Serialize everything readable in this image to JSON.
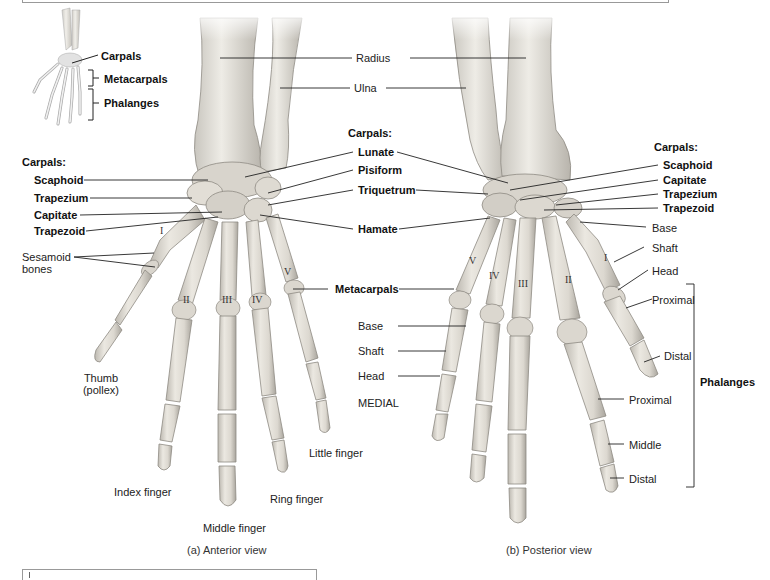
{
  "inset": {
    "labels": {
      "carpals": "Carpals",
      "metacarpals": "Metacarpals",
      "phalanges": "Phalanges"
    }
  },
  "forearm": {
    "radius": "Radius",
    "ulna": "Ulna"
  },
  "anterior_view": {
    "caption": "(a) Anterior view",
    "carpals_heading": "Carpals:",
    "carpals_left": [
      "Scaphoid",
      "Trapezium",
      "Capitate",
      "Trapezoid"
    ],
    "sesamoid": [
      "Sesamoid",
      "bones"
    ],
    "thumb": [
      "Thumb",
      "(pollex)"
    ],
    "fingers": {
      "index": "Index finger",
      "middle": "Middle finger",
      "ring": "Ring finger",
      "little": "Little finger"
    },
    "metacarpal_numerals": [
      "I",
      "II",
      "III",
      "IV",
      "V"
    ]
  },
  "center_labels": {
    "carpals_heading": "Carpals:",
    "carpals": [
      "Lunate",
      "Pisiform",
      "Triquetrum",
      "Hamate"
    ],
    "metacarpals": "Metacarpals"
  },
  "posterior_view": {
    "caption": "(b) Posterior view",
    "carpals_heading": "Carpals:",
    "carpals_right": [
      "Scaphoid",
      "Capitate",
      "Trapezium",
      "Trapezoid"
    ],
    "metacarpal_parts_right": [
      "Base",
      "Shaft",
      "Head"
    ],
    "metacarpal_parts_left": [
      "Base",
      "Shaft",
      "Head"
    ],
    "medial": "MEDIAL",
    "thumb_phalanges": [
      "Proximal",
      "Distal"
    ],
    "finger_phalanges": [
      "Proximal",
      "Middle",
      "Distal"
    ],
    "phalanges_bracket": "Phalanges",
    "metacarpal_numerals": [
      "V",
      "IV",
      "III",
      "II",
      "I"
    ]
  },
  "colors": {
    "bone_fill": "#e6e3dc",
    "bone_shade": "#b9b5ad",
    "leader_line": "#222222",
    "background": "#ffffff"
  }
}
